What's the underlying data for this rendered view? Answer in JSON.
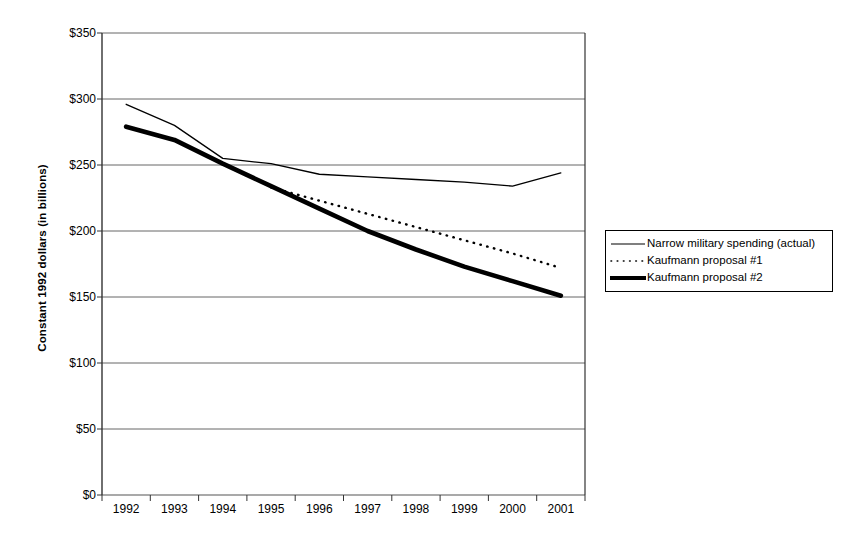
{
  "chart_data": {
    "type": "line",
    "title": "",
    "xlabel": "",
    "ylabel": "Constant 1992 dollars (in billions)",
    "categories": [
      "1992",
      "1993",
      "1994",
      "1995",
      "1996",
      "1997",
      "1998",
      "1999",
      "2000",
      "2001"
    ],
    "ylim": [
      0,
      350
    ],
    "y_ticks": [
      0,
      50,
      100,
      150,
      200,
      250,
      300,
      350
    ],
    "y_tick_labels": [
      "$0",
      "$50",
      "$100",
      "$150",
      "$200",
      "$250",
      "$300",
      "$350"
    ],
    "grid": "horizontal",
    "legend_position": "right",
    "series": [
      {
        "name": "Narrow military spending (actual)",
        "style": "solid-thin",
        "color": "#000000",
        "values": [
          296,
          280,
          255,
          251,
          243,
          241,
          239,
          237,
          234,
          244
        ]
      },
      {
        "name": "Kaufmann proposal #1",
        "style": "dotted",
        "color": "#000000",
        "values": [
          null,
          null,
          null,
          233,
          223,
          213,
          203,
          193,
          183,
          172
        ]
      },
      {
        "name": "Kaufmann proposal #2",
        "style": "solid-thick",
        "color": "#000000",
        "values": [
          279,
          269,
          251,
          234,
          217,
          200,
          186,
          173,
          162,
          151
        ]
      }
    ]
  },
  "axes": {
    "y_title": "Constant 1992 dollars (in billions)"
  },
  "legend": {
    "items": [
      {
        "label": "Narrow military spending (actual)",
        "icon": "solid-thin-line-icon"
      },
      {
        "label": "Kaufmann proposal #1",
        "icon": "dotted-line-icon"
      },
      {
        "label": "Kaufmann proposal #2",
        "icon": "solid-thick-line-icon"
      }
    ]
  },
  "colors": {
    "ink": "#000000",
    "grid": "#555555",
    "background": "#ffffff"
  }
}
